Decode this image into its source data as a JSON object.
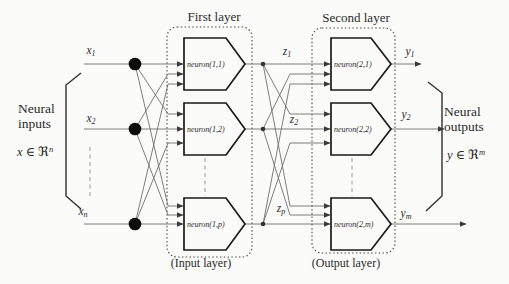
{
  "titles": {
    "first_layer": "First layer",
    "second_layer": "Second layer"
  },
  "captions": {
    "input_layer": "(Input layer)",
    "output_layer": "(Output layer)"
  },
  "side_labels": {
    "left": {
      "line1": "Neural",
      "line2": "inputs",
      "domain_var": "x",
      "domain_rel": "∈",
      "domain_set": "ℜ",
      "domain_sup": "n"
    },
    "right": {
      "line1": "Neural",
      "line2": "outputs",
      "domain_var": "y",
      "domain_rel": "∈",
      "domain_set": "ℜ",
      "domain_sup": "m"
    }
  },
  "inputs": [
    {
      "base": "x",
      "sub": "1"
    },
    {
      "base": "x",
      "sub": "2"
    },
    {
      "base": "x",
      "sub": "n"
    }
  ],
  "hidden_outputs": [
    {
      "base": "z",
      "sub": "1"
    },
    {
      "base": "z",
      "sub": "2"
    },
    {
      "base": "z",
      "sub": "p"
    }
  ],
  "outputs": [
    {
      "base": "y",
      "sub": "1"
    },
    {
      "base": "y",
      "sub": "2"
    },
    {
      "base": "y",
      "sub": "m"
    }
  ],
  "neurons": {
    "first": [
      "neuron(1,1)",
      "neuron(1,2)",
      "neuron(1,p)"
    ],
    "second": [
      "neuron(2,1)",
      "neuron(2,2)",
      "neuron(2,m)"
    ]
  },
  "colors": {
    "ink": "#2a2a2a",
    "wire": "#6e6e6e",
    "outline": "#1a1a1a",
    "dot": "#0d0d0d",
    "background": "#fbfbf9"
  }
}
